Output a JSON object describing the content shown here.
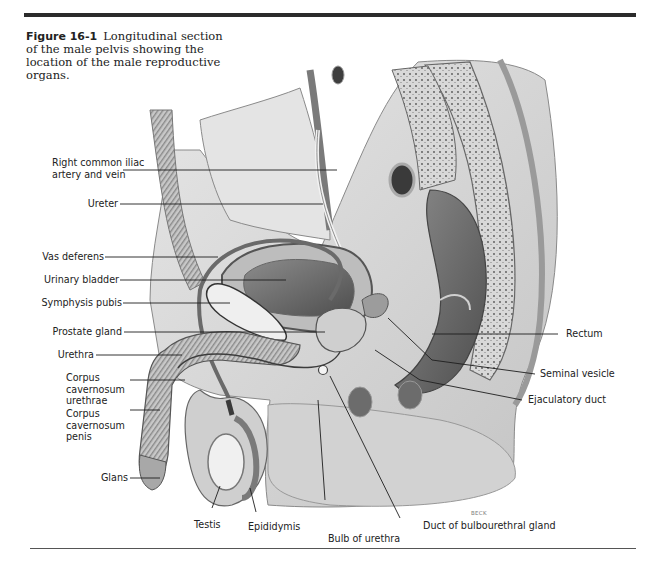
{
  "figure": {
    "number": "Figure 16-1",
    "caption": "Longitudinal section of the male pelvis showing the location of the male reproductive organs.",
    "artist_credit": "BECK"
  },
  "labels": {
    "left": [
      {
        "id": "right-common-iliac",
        "text": "Right common iliac\nartery and vein"
      },
      {
        "id": "ureter",
        "text": "Ureter"
      },
      {
        "id": "vas-deferens",
        "text": "Vas deferens"
      },
      {
        "id": "urinary-bladder",
        "text": "Urinary bladder"
      },
      {
        "id": "symphysis-pubis",
        "text": "Symphysis pubis"
      },
      {
        "id": "prostate-gland",
        "text": "Prostate gland"
      },
      {
        "id": "urethra",
        "text": "Urethra"
      },
      {
        "id": "corpus-cavernosum-urethrae",
        "text": "Corpus\ncavernosum\nurethrae"
      },
      {
        "id": "corpus-cavernosum-penis",
        "text": "Corpus\ncavernosum\npenis"
      },
      {
        "id": "glans",
        "text": "Glans"
      }
    ],
    "right": [
      {
        "id": "rectum",
        "text": "Rectum"
      },
      {
        "id": "seminal-vesicle",
        "text": "Seminal vesicle"
      },
      {
        "id": "ejaculatory-duct",
        "text": "Ejaculatory duct"
      }
    ],
    "bottom": [
      {
        "id": "testis",
        "text": "Testis"
      },
      {
        "id": "epididymis",
        "text": "Epididymis"
      },
      {
        "id": "bulb-of-urethra",
        "text": "Bulb of urethra"
      },
      {
        "id": "duct-of-bulbourethral-gland",
        "text": "Duct of bulbourethral gland"
      }
    ]
  },
  "colors": {
    "rule": "#2b2b2b",
    "leader": "#1e1e1e",
    "tissue_light": "#dcdcdc",
    "tissue_mid": "#a9a9a9",
    "tissue_dark": "#5e5e5e"
  }
}
